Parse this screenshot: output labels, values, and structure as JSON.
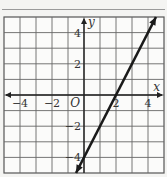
{
  "chart_data": {
    "type": "line",
    "title": "",
    "xlabel": "x",
    "ylabel": "y",
    "xlim": [
      -5,
      5
    ],
    "ylim": [
      -5,
      5
    ],
    "grid": true,
    "origin_label": "O",
    "x_ticks": [
      {
        "value": -4,
        "label": "−4"
      },
      {
        "value": -2,
        "label": "−2"
      },
      {
        "value": 2,
        "label": "2"
      },
      {
        "value": 4,
        "label": "4"
      }
    ],
    "y_ticks": [
      {
        "value": 4,
        "label": "4"
      },
      {
        "value": 2,
        "label": "2"
      },
      {
        "value": -2,
        "label": "−2"
      },
      {
        "value": -4,
        "label": "−4"
      }
    ],
    "series": [
      {
        "name": "line",
        "equation": "y = 2x − 4",
        "points": [
          [
            -0.5,
            -5
          ],
          [
            4.5,
            5
          ]
        ],
        "arrows": "both",
        "color": "#1a1a1a"
      }
    ]
  }
}
